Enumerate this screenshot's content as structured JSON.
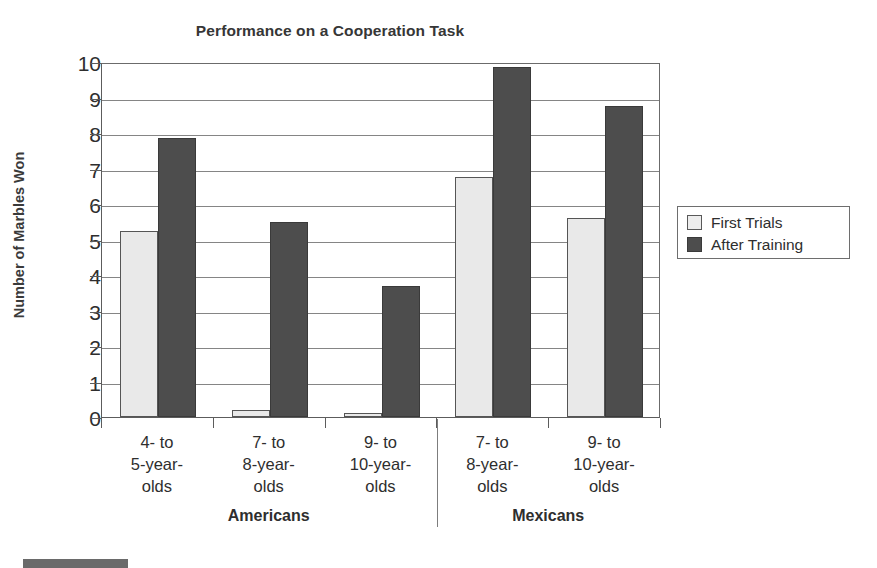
{
  "chart_data": {
    "type": "bar",
    "title": "Performance on a Cooperation Task",
    "xlabel": "",
    "ylabel": "Number of Marbles Won",
    "ylim": [
      0,
      10
    ],
    "ytick_step": 1,
    "yticks": [
      "10",
      "9",
      "8",
      "7",
      "6",
      "5",
      "4",
      "3",
      "2",
      "1",
      "0"
    ],
    "grid": true,
    "legend_position": "right",
    "categories": [
      "4- to\n5-year-\nolds",
      "7- to\n8-year-\nolds",
      "9- to\n10-year-\nolds",
      "7- to\n8-year-\nolds",
      "9- to\n10-year-\nolds"
    ],
    "category_lines": [
      [
        "4- to",
        "5-year-",
        "olds"
      ],
      [
        "7- to",
        "8-year-",
        "olds"
      ],
      [
        "9- to",
        "10-year-",
        "olds"
      ],
      [
        "7- to",
        "8-year-",
        "olds"
      ],
      [
        "9- to",
        "10-year-",
        "olds"
      ]
    ],
    "groups": [
      {
        "label": "Americans",
        "category_indices": [
          0,
          1,
          2
        ]
      },
      {
        "label": "Mexicans",
        "category_indices": [
          3,
          4
        ]
      }
    ],
    "series": [
      {
        "name": "First Trials",
        "color": "#e9e9e9",
        "values": [
          5.25,
          0.2,
          0.1,
          6.75,
          5.6
        ]
      },
      {
        "name": "After Training",
        "color": "#4d4d4d",
        "values": [
          7.85,
          5.5,
          3.7,
          9.85,
          8.75
        ]
      }
    ]
  },
  "legend": {
    "items": [
      {
        "label": "First Trials",
        "swatch": "light"
      },
      {
        "label": "After Training",
        "swatch": "dark"
      }
    ]
  },
  "colors": {
    "light_bar": "#e9e9e9",
    "dark_bar": "#4d4d4d",
    "gridline": "#858585",
    "axis": "#5c5c5c",
    "text": "#2e2e2e",
    "background": "#ffffff"
  }
}
